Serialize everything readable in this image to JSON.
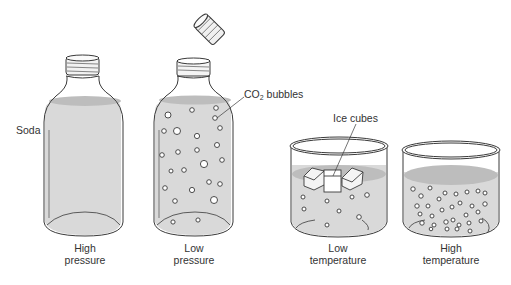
{
  "diagram": {
    "colors": {
      "liquid": "#d9d9d9",
      "liquid_surface": "#bdbdbd",
      "outline": "#3a3a3a",
      "text": "#333333"
    },
    "panels": [
      {
        "id": "bottle-closed",
        "caption_line1": "High",
        "caption_line2": "pressure"
      },
      {
        "id": "bottle-open",
        "caption_line1": "Low",
        "caption_line2": "pressure"
      },
      {
        "id": "beaker-cold",
        "caption_line1": "Low",
        "caption_line2": "temperature"
      },
      {
        "id": "beaker-warm",
        "caption_line1": "High",
        "caption_line2": "temperature"
      }
    ],
    "labels": {
      "soda": "Soda",
      "co2_prefix": "CO",
      "co2_subscript": "2",
      "co2_suffix": " bubbles",
      "ice_cubes": "Ice cubes"
    }
  }
}
